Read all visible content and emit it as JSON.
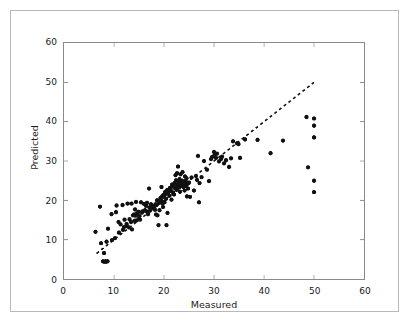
{
  "figure": {
    "background_color": "#ffffff",
    "border_color": "#b9b9b9",
    "axes_color": "#8a8a8a",
    "marker_color": "#111111",
    "line_color": "#111111"
  },
  "chart_data": {
    "type": "scatter",
    "title": "",
    "xlabel": "Measured",
    "ylabel": "Predicted",
    "xlim": [
      0,
      60
    ],
    "ylim": [
      0,
      60
    ],
    "xticks": [
      0,
      10,
      20,
      30,
      40,
      50,
      60
    ],
    "yticks": [
      0,
      10,
      20,
      30,
      40,
      50,
      60
    ],
    "xtick_labels": [
      "0",
      "10",
      "20",
      "30",
      "40",
      "50",
      "60"
    ],
    "ytick_labels": [
      "0",
      "10",
      "20",
      "30",
      "40",
      "50",
      "60"
    ],
    "grid": false,
    "legend": null,
    "marker": "circle",
    "marker_size": 3.4,
    "reference_line": {
      "name": "identity-line",
      "style": "dashed",
      "x": [
        6.5,
        50.0
      ],
      "y": [
        6.5,
        50.0
      ],
      "dash_pattern": [
        3,
        3
      ],
      "width": 1.6
    },
    "points": [
      [
        6.3,
        12.0
      ],
      [
        7.2,
        18.4
      ],
      [
        7.4,
        9.1
      ],
      [
        7.8,
        4.5
      ],
      [
        8.0,
        6.6
      ],
      [
        8.1,
        4.4
      ],
      [
        8.3,
        4.5
      ],
      [
        8.4,
        4.4
      ],
      [
        8.5,
        9.5
      ],
      [
        8.7,
        4.5
      ],
      [
        8.8,
        12.8
      ],
      [
        9.5,
        16.5
      ],
      [
        9.6,
        9.9
      ],
      [
        10.2,
        10.4
      ],
      [
        10.4,
        17.0
      ],
      [
        10.5,
        18.7
      ],
      [
        10.9,
        14.5
      ],
      [
        11.0,
        11.8
      ],
      [
        11.3,
        13.9
      ],
      [
        11.7,
        18.8
      ],
      [
        11.8,
        12.5
      ],
      [
        12.0,
        13.2
      ],
      [
        12.1,
        15.1
      ],
      [
        12.5,
        14.0
      ],
      [
        12.6,
        13.5
      ],
      [
        12.7,
        19.2
      ],
      [
        13.0,
        13.1
      ],
      [
        13.1,
        15.2
      ],
      [
        13.4,
        14.5
      ],
      [
        13.5,
        19.2
      ],
      [
        13.6,
        12.6
      ],
      [
        13.8,
        16.2
      ],
      [
        14.0,
        16.4
      ],
      [
        14.1,
        14.8
      ],
      [
        14.2,
        17.7
      ],
      [
        14.3,
        16.1
      ],
      [
        14.4,
        19.6
      ],
      [
        14.5,
        14.9
      ],
      [
        14.6,
        16.7
      ],
      [
        14.9,
        17.1
      ],
      [
        15.0,
        15.4
      ],
      [
        15.1,
        16.0
      ],
      [
        15.2,
        15.1
      ],
      [
        15.4,
        19.5
      ],
      [
        15.6,
        16.9
      ],
      [
        15.7,
        17.2
      ],
      [
        16.0,
        19.1
      ],
      [
        16.1,
        17.4
      ],
      [
        16.2,
        17.5
      ],
      [
        16.4,
        18.6
      ],
      [
        16.5,
        17.2
      ],
      [
        16.6,
        19.4
      ],
      [
        16.8,
        16.5
      ],
      [
        17.0,
        23.0
      ],
      [
        17.1,
        18.2
      ],
      [
        17.2,
        17.4
      ],
      [
        17.4,
        19.0
      ],
      [
        17.5,
        17.9
      ],
      [
        17.8,
        18.5
      ],
      [
        18.0,
        18.1
      ],
      [
        18.2,
        17.6
      ],
      [
        18.3,
        19.0
      ],
      [
        18.4,
        16.4
      ],
      [
        18.5,
        18.8
      ],
      [
        18.6,
        20.0
      ],
      [
        18.7,
        16.2
      ],
      [
        18.9,
        13.7
      ],
      [
        19.0,
        19.4
      ],
      [
        19.1,
        17.5
      ],
      [
        19.2,
        19.8
      ],
      [
        19.3,
        20.6
      ],
      [
        19.4,
        20.1
      ],
      [
        19.5,
        23.4
      ],
      [
        19.6,
        21.0
      ],
      [
        19.7,
        19.2
      ],
      [
        19.8,
        18.3
      ],
      [
        19.9,
        21.4
      ],
      [
        20.0,
        20.9
      ],
      [
        20.1,
        19.5
      ],
      [
        20.2,
        22.1
      ],
      [
        20.3,
        21.6
      ],
      [
        20.4,
        20.4
      ],
      [
        20.5,
        13.7
      ],
      [
        20.6,
        22.6
      ],
      [
        20.7,
        16.8
      ],
      [
        20.8,
        21.9
      ],
      [
        21.0,
        22.8
      ],
      [
        21.1,
        21.2
      ],
      [
        21.2,
        23.2
      ],
      [
        21.4,
        22.4
      ],
      [
        21.5,
        20.2
      ],
      [
        21.6,
        24.0
      ],
      [
        21.7,
        23.5
      ],
      [
        21.8,
        22.0
      ],
      [
        21.9,
        23.8
      ],
      [
        22.0,
        21.5
      ],
      [
        22.1,
        24.4
      ],
      [
        22.2,
        23.1
      ],
      [
        22.3,
        26.4
      ],
      [
        22.4,
        25.1
      ],
      [
        22.5,
        22.7
      ],
      [
        22.6,
        26.9
      ],
      [
        22.7,
        23.9
      ],
      [
        22.8,
        28.6
      ],
      [
        22.9,
        24.6
      ],
      [
        23.0,
        23.3
      ],
      [
        23.1,
        25.4
      ],
      [
        23.2,
        22.2
      ],
      [
        23.3,
        26.6
      ],
      [
        23.4,
        24.1
      ],
      [
        23.5,
        23.6
      ],
      [
        23.6,
        25.0
      ],
      [
        23.7,
        27.2
      ],
      [
        23.8,
        24.8
      ],
      [
        23.9,
        23.4
      ],
      [
        24.0,
        24.3
      ],
      [
        24.1,
        22.5
      ],
      [
        24.2,
        26.1
      ],
      [
        24.3,
        24.9
      ],
      [
        24.4,
        23.7
      ],
      [
        24.5,
        25.6
      ],
      [
        24.6,
        21.0
      ],
      [
        24.7,
        24.2
      ],
      [
        24.8,
        23.0
      ],
      [
        25.0,
        24.5
      ],
      [
        25.2,
        20.9
      ],
      [
        25.5,
        25.8
      ],
      [
        26.0,
        22.5
      ],
      [
        26.4,
        26.2
      ],
      [
        26.6,
        25.2
      ],
      [
        26.8,
        31.3
      ],
      [
        27.0,
        19.5
      ],
      [
        27.1,
        24.4
      ],
      [
        27.5,
        25.9
      ],
      [
        28.0,
        30.0
      ],
      [
        28.6,
        27.8
      ],
      [
        29.0,
        24.9
      ],
      [
        29.4,
        30.5
      ],
      [
        29.6,
        31.0
      ],
      [
        30.0,
        32.3
      ],
      [
        30.1,
        31.5
      ],
      [
        30.4,
        30.8
      ],
      [
        30.6,
        31.9
      ],
      [
        31.0,
        29.9
      ],
      [
        31.4,
        30.5
      ],
      [
        31.6,
        31.1
      ],
      [
        32.0,
        29.4
      ],
      [
        32.4,
        30.2
      ],
      [
        33.0,
        28.5
      ],
      [
        33.4,
        30.7
      ],
      [
        33.8,
        35.0
      ],
      [
        34.6,
        34.5
      ],
      [
        34.9,
        34.3
      ],
      [
        35.2,
        30.8
      ],
      [
        36.2,
        35.5
      ],
      [
        38.7,
        35.4
      ],
      [
        41.3,
        32.0
      ],
      [
        43.8,
        35.2
      ],
      [
        48.5,
        41.2
      ],
      [
        48.8,
        28.4
      ],
      [
        50.0,
        40.8
      ],
      [
        50.0,
        39.0
      ],
      [
        50.0,
        36.0
      ],
      [
        50.0,
        25.0
      ],
      [
        50.0,
        22.1
      ]
    ]
  }
}
